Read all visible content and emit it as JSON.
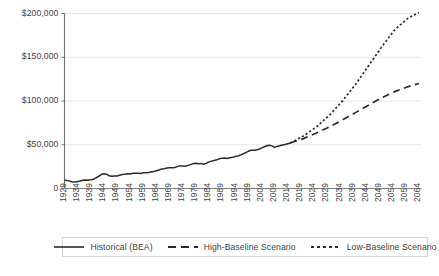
{
  "chart_data": {
    "type": "line",
    "title": "",
    "xlabel": "",
    "ylabel": "",
    "ylim": [
      0,
      200000
    ],
    "xlim": [
      1929,
      2065
    ],
    "grid": true,
    "legend_position": "bottom",
    "y_ticks": [
      "0",
      "$50,000",
      "$100,000",
      "$150,000",
      "$200,000"
    ],
    "y_tick_values": [
      0,
      50000,
      100000,
      150000,
      200000
    ],
    "x_ticks": [
      "1929",
      "1934",
      "1939",
      "1944",
      "1949",
      "1954",
      "1959",
      "1964",
      "1969",
      "1974",
      "1979",
      "1984",
      "1989",
      "1994",
      "1999",
      "2004",
      "2009",
      "2014",
      "2019",
      "2024",
      "2029",
      "2034",
      "2039",
      "2044",
      "2049",
      "2054",
      "2059",
      "2064"
    ],
    "series": [
      {
        "name": "Historical (BEA)",
        "style": "solid",
        "color": "#2b2b2b",
        "x": [
          1929,
          1930,
          1931,
          1932,
          1933,
          1934,
          1935,
          1936,
          1937,
          1938,
          1939,
          1940,
          1941,
          1942,
          1943,
          1944,
          1945,
          1946,
          1947,
          1948,
          1949,
          1950,
          1951,
          1952,
          1953,
          1954,
          1955,
          1956,
          1957,
          1958,
          1959,
          1960,
          1961,
          1962,
          1963,
          1964,
          1965,
          1966,
          1967,
          1968,
          1969,
          1970,
          1971,
          1972,
          1973,
          1974,
          1975,
          1976,
          1977,
          1978,
          1979,
          1980,
          1981,
          1982,
          1983,
          1984,
          1985,
          1986,
          1987,
          1988,
          1989,
          1990,
          1991,
          1992,
          1993,
          1994,
          1995,
          1996,
          1997,
          1998,
          1999,
          2000,
          2001,
          2002,
          2003,
          2004,
          2005,
          2006,
          2007,
          2008,
          2009,
          2010,
          2011,
          2012,
          2013,
          2014,
          2015
        ],
        "values": [
          9800,
          9000,
          8500,
          7500,
          7300,
          7900,
          8500,
          9500,
          9800,
          9300,
          9900,
          10600,
          12200,
          14000,
          15900,
          16800,
          16400,
          14500,
          14100,
          14400,
          14200,
          15200,
          16100,
          16400,
          16900,
          16500,
          17400,
          17500,
          17500,
          17100,
          18000,
          18100,
          18200,
          18900,
          19400,
          20200,
          21200,
          22300,
          22600,
          23400,
          23800,
          23600,
          24000,
          25000,
          26100,
          25700,
          25400,
          26400,
          27300,
          28400,
          28900,
          28300,
          28700,
          27800,
          28700,
          30400,
          31300,
          32100,
          32900,
          33900,
          34700,
          34900,
          34300,
          35100,
          35600,
          36600,
          37200,
          38200,
          39500,
          40900,
          42500,
          43700,
          43600,
          43900,
          44900,
          46200,
          47500,
          48800,
          49400,
          48700,
          47000,
          48100,
          48800,
          49700,
          50200,
          51200,
          52000
        ]
      },
      {
        "name": "High-Baseline Scenario",
        "style": "dashed",
        "color": "#2b2b2b",
        "x": [
          2015,
          2020,
          2025,
          2030,
          2035,
          2040,
          2045,
          2050,
          2055,
          2060,
          2064
        ],
        "values": [
          52000,
          57000,
          63500,
          70500,
          78500,
          87000,
          95500,
          104000,
          111000,
          116500,
          120000
        ]
      },
      {
        "name": "Low-Baseline Scenario",
        "style": "dotted",
        "color": "#2b2b2b",
        "x": [
          2015,
          2020,
          2025,
          2030,
          2035,
          2040,
          2045,
          2050,
          2055,
          2060,
          2064
        ],
        "values": [
          52000,
          60000,
          70500,
          84000,
          100500,
          119500,
          141000,
          162500,
          182000,
          195000,
          201000
        ]
      }
    ]
  },
  "legend": {
    "items": [
      {
        "label": "Historical (BEA)",
        "style": "solid"
      },
      {
        "label": "High-Baseline Scenario",
        "style": "dashed"
      },
      {
        "label": "Low-Baseline Scenario",
        "style": "dotted"
      }
    ]
  },
  "colors": {
    "line": "#2b2b2b",
    "axis": "#808080",
    "grid": "#e6e6e6",
    "text": "#3f3f3f",
    "legend_border": "#d4d4d4"
  }
}
